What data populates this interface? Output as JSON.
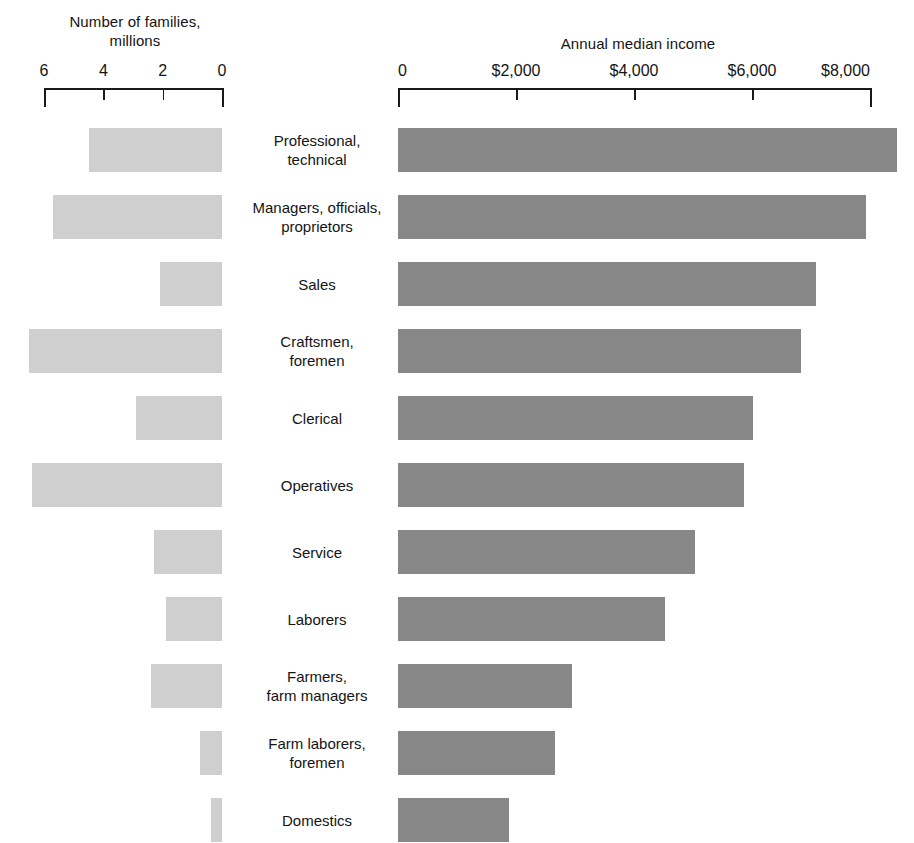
{
  "chart_data": {
    "type": "bar",
    "title": "",
    "orientation": "horizontal-bidirectional",
    "categories": [
      "Professional,\ntechnical",
      "Managers, officials,\nproprietors",
      "Sales",
      "Craftsmen,\nforemen",
      "Clerical",
      "Operatives",
      "Service",
      "Laborers",
      "Farmers,\nfarm managers",
      "Farm laborers,\nforemen",
      "Domestics"
    ],
    "series": [
      {
        "name": "Number of families, millions",
        "side": "left",
        "direction": "right-to-left",
        "axis_label": "Number of families,\nmillions",
        "unit": "millions",
        "ticks": [
          6,
          4,
          2,
          0
        ],
        "tick_labels": [
          "6",
          "4",
          "2",
          "0"
        ],
        "axis_min": 0,
        "axis_max": 6,
        "color": "#cfcfcf",
        "values": [
          4.5,
          5.7,
          2.1,
          6.5,
          2.9,
          6.4,
          2.3,
          1.9,
          2.4,
          0.75,
          0.37
        ]
      },
      {
        "name": "Annual median income",
        "side": "right",
        "direction": "left-to-right",
        "axis_label": "Annual median income",
        "unit": "dollars",
        "ticks": [
          0,
          2000,
          4000,
          6000,
          8000
        ],
        "tick_labels": [
          "0",
          "$2,000",
          "$4,000",
          "$6,000",
          "$8,000"
        ],
        "axis_min": 0,
        "axis_max": 8400,
        "color": "#878787",
        "values": [
          8450,
          7930,
          7080,
          6830,
          6020,
          5870,
          5030,
          4520,
          2950,
          2660,
          1880
        ]
      }
    ],
    "grid": false,
    "legend": "none",
    "background": "#ffffff"
  }
}
